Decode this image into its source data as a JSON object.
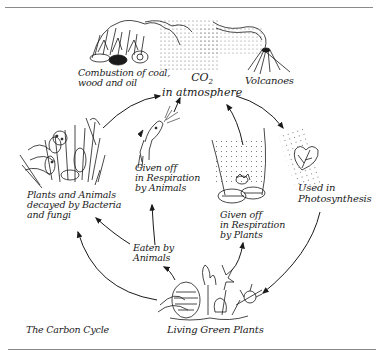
{
  "diagram": {
    "title": "The Carbon Cycle",
    "center": {
      "line1": "CO",
      "subscript": "2",
      "line2": "in atmosphere"
    },
    "nodes": {
      "combustion": {
        "line1": "Combustion of coal,",
        "line2": "wood and oil",
        "icon": "fire-icon"
      },
      "volcanoes": {
        "label": "Volcanoes",
        "icon": "volcano-icon"
      },
      "photosynthesis": {
        "line1": "Used in",
        "line2": "Photosynthesis",
        "icon": "leaf-icon"
      },
      "plant_respiration": {
        "line1": "Given off",
        "line2": "in Respiration",
        "line3": "by Plants",
        "icon": "leaves-icon"
      },
      "animal_respiration": {
        "line1": "Given off",
        "line2": "in Respiration",
        "line3": "by Animals",
        "icon": "animal-head-icon"
      },
      "eaten": {
        "line1": "Eaten by",
        "line2": "Animals"
      },
      "decay": {
        "line1": "Plants and Animals",
        "line2": "decayed by Bacteria",
        "line3": "and fungi",
        "icon": "decaying-matter-icon"
      },
      "green_plants": {
        "label": "Living Green Plants",
        "icon": "plants-icon"
      }
    },
    "arrows": [
      {
        "from": "decay",
        "to": "atmosphere"
      },
      {
        "from": "animal_respiration",
        "to": "atmosphere"
      },
      {
        "from": "plant_respiration",
        "to": "atmosphere"
      },
      {
        "from": "atmosphere",
        "to": "photosynthesis"
      },
      {
        "from": "photosynthesis",
        "to": "green_plants"
      },
      {
        "from": "green_plants",
        "to": "plant_respiration"
      },
      {
        "from": "green_plants",
        "to": "eaten"
      },
      {
        "from": "green_plants",
        "to": "decay"
      },
      {
        "from": "eaten",
        "to": "animal_respiration"
      },
      {
        "from": "eaten",
        "to": "decay"
      }
    ],
    "colors": {
      "ink": "#1a1a1a",
      "frame": "#8a8a8a",
      "background": "#ffffff"
    }
  }
}
